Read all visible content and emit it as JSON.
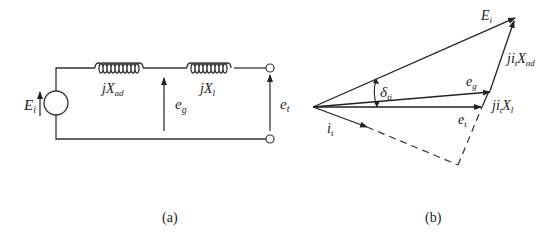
{
  "figure": {
    "panel_a": {
      "caption": "(a)",
      "source_label": "E",
      "source_sub": "i",
      "inductor1_label": "jX",
      "inductor1_sub": "ad",
      "inductor2_label": "jX",
      "inductor2_sub": "l",
      "mid_voltage_label": "e",
      "mid_voltage_sub": "g",
      "terminal_voltage_label": "e",
      "terminal_voltage_sub": "t"
    },
    "panel_b": {
      "caption": "(b)",
      "Ei_label": "E",
      "Ei_sub": "i",
      "eg_label": "e",
      "eg_sub": "g",
      "et_label": "e",
      "et_sub": "t",
      "it_label": "i",
      "it_sub": "t",
      "angle_label": "δ",
      "angle_sub": "ti",
      "drop_ad_label": "ji",
      "drop_ad_sub1": "t",
      "drop_ad_mid": "X",
      "drop_ad_sub2": "ad",
      "drop_l_label": "ji",
      "drop_l_sub1": "t",
      "drop_l_mid": "X",
      "drop_l_sub2": "l"
    },
    "colors": {
      "line": "#333333",
      "text": "#222222",
      "background": "#ffffff"
    }
  }
}
